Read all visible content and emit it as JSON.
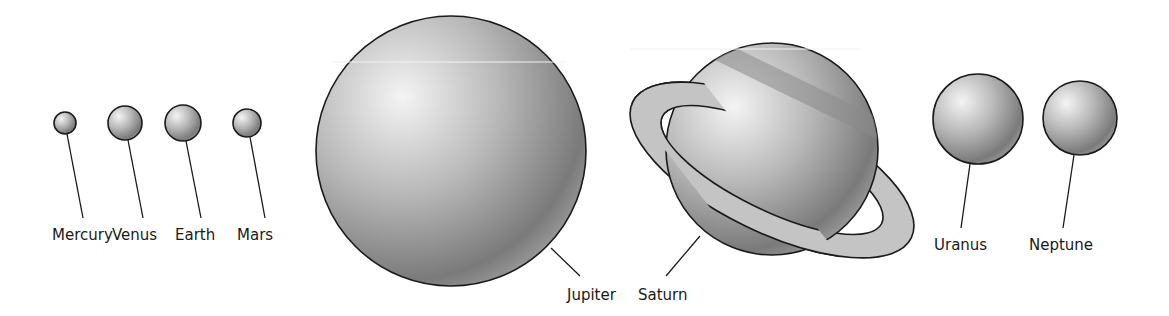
{
  "colors": {
    "highlight": "#f4f4f4",
    "mid": "#b8b8b8",
    "shadow": "#7a7a7a",
    "outline": "#1a1a1a",
    "ring": "#c4c4c4",
    "band": "#8a8a8a",
    "background": "#ffffff"
  },
  "planets": [
    {
      "id": "mercury",
      "name": "Mercury",
      "cx": 65,
      "cy": 123,
      "r": 11,
      "line": [
        67,
        134,
        83,
        218
      ],
      "label_x": 52,
      "label_y": 240
    },
    {
      "id": "venus",
      "name": "Venus",
      "cx": 125,
      "cy": 123,
      "r": 17,
      "line": [
        128,
        140,
        143,
        218
      ],
      "label_x": 112,
      "label_y": 240
    },
    {
      "id": "earth",
      "name": "Earth",
      "cx": 183,
      "cy": 123,
      "r": 18,
      "line": [
        186,
        141,
        201,
        218
      ],
      "label_x": 175,
      "label_y": 240
    },
    {
      "id": "mars",
      "name": "Mars",
      "cx": 247,
      "cy": 123,
      "r": 14,
      "line": [
        250,
        137,
        265,
        218
      ],
      "label_x": 237,
      "label_y": 240
    },
    {
      "id": "jupiter",
      "name": "Jupiter",
      "cx": 451,
      "cy": 151,
      "r": 135,
      "line": [
        551,
        248,
        580,
        276
      ],
      "label_x": 567,
      "label_y": 300
    },
    {
      "id": "saturn",
      "name": "Saturn",
      "cx": 772,
      "cy": 149,
      "r": 106,
      "line": [
        700,
        236,
        666,
        276
      ],
      "label_x": 638,
      "label_y": 300
    },
    {
      "id": "uranus",
      "name": "Uranus",
      "cx": 978,
      "cy": 119,
      "r": 45,
      "line": [
        970,
        164,
        961,
        228
      ],
      "label_x": 934,
      "label_y": 250
    },
    {
      "id": "neptune",
      "name": "Neptune",
      "cx": 1080,
      "cy": 118,
      "r": 37,
      "line": [
        1074,
        155,
        1063,
        228
      ],
      "label_x": 1029,
      "label_y": 250
    }
  ],
  "saturn_ring": {
    "cx": 772,
    "cy": 170,
    "rx": 155,
    "ry": 62,
    "inner_rx": 122,
    "inner_ry": 40,
    "rotate": 26
  }
}
